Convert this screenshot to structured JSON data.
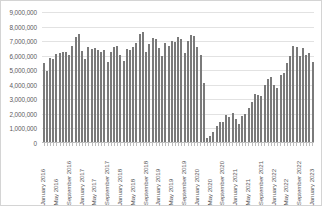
{
  "chart_data": {
    "type": "bar",
    "title": "",
    "subtitle": "",
    "xlabel": "",
    "ylabel": "",
    "ylim": [
      0,
      9000000
    ],
    "ytick_step": 1000000,
    "yticks": [
      "0",
      "1,000,000",
      "2,000,000",
      "3,000,000",
      "4,000,000",
      "5,000,000",
      "6,000,000",
      "7,000,000",
      "8,000,000",
      "9,000,000"
    ],
    "grid": true,
    "legend": "none",
    "bar_color": "#7a7a7a",
    "gridline_color": "#e2e2e2",
    "axis_color": "#bdbdbd",
    "border_color": "#d4d4d4",
    "text_color": "#59595b",
    "xtick_interval_months": 4,
    "xtick_labels": [
      "January 2016",
      "May 2016",
      "September 2016",
      "January 2017",
      "May 2017",
      "September 2017",
      "January 2018",
      "May 2018",
      "September 2018",
      "January 2019",
      "May 2019",
      "September 2019",
      "January 2020",
      "May 2020",
      "September 2020",
      "January 2021",
      "May 2021",
      "September 2021",
      "January 2022",
      "May 2022",
      "September 2022",
      "January 2023"
    ],
    "categories": [
      "January 2016",
      "February 2016",
      "March 2016",
      "April 2016",
      "May 2016",
      "June 2016",
      "July 2016",
      "August 2016",
      "September 2016",
      "October 2016",
      "November 2016",
      "December 2016",
      "January 2017",
      "February 2017",
      "March 2017",
      "April 2017",
      "May 2017",
      "June 2017",
      "July 2017",
      "August 2017",
      "September 2017",
      "October 2017",
      "November 2017",
      "December 2017",
      "January 2018",
      "February 2018",
      "March 2018",
      "April 2018",
      "May 2018",
      "June 2018",
      "July 2018",
      "August 2018",
      "September 2018",
      "October 2018",
      "November 2018",
      "December 2018",
      "January 2019",
      "February 2019",
      "March 2019",
      "April 2019",
      "May 2019",
      "June 2019",
      "July 2019",
      "August 2019",
      "September 2019",
      "October 2019",
      "November 2019",
      "December 2019",
      "January 2020",
      "February 2020",
      "March 2020",
      "April 2020",
      "May 2020",
      "June 2020",
      "July 2020",
      "August 2020",
      "September 2020",
      "October 2020",
      "November 2020",
      "December 2020",
      "January 2021",
      "February 2021",
      "March 2021",
      "April 2021",
      "May 2021",
      "June 2021",
      "July 2021",
      "August 2021",
      "September 2021",
      "October 2021",
      "November 2021",
      "December 2021",
      "January 2022",
      "February 2022",
      "March 2022",
      "April 2022",
      "May 2022",
      "June 2022",
      "July 2022",
      "August 2022",
      "September 2022",
      "October 2022",
      "November 2022",
      "December 2022",
      "January 2023"
    ],
    "values": [
      5400000,
      4850000,
      5750000,
      5700000,
      6050000,
      6100000,
      6200000,
      6150000,
      6000000,
      6600000,
      7200000,
      7400000,
      6250000,
      5700000,
      6500000,
      6400000,
      6450000,
      6300000,
      6200000,
      6350000,
      5500000,
      6150000,
      6500000,
      6600000,
      6000000,
      5600000,
      6400000,
      6300000,
      6550000,
      6800000,
      7400000,
      7550000,
      6150000,
      6750000,
      7150000,
      7050000,
      6450000,
      5900000,
      6800000,
      6600000,
      6950000,
      6900000,
      7200000,
      7050000,
      6100000,
      6950000,
      7350000,
      7250000,
      6550000,
      5950000,
      4050000,
      250000,
      400000,
      700000,
      1100000,
      1350000,
      1400000,
      1850000,
      1700000,
      2000000,
      1550000,
      1250000,
      1800000,
      1950000,
      2350000,
      2750000,
      3300000,
      3250000,
      3150000,
      3900000,
      4350000,
      4500000,
      3950000,
      3700000,
      4600000,
      4750000,
      5400000,
      5900000,
      6600000,
      6500000,
      5900000,
      6450000,
      6000000,
      6100000,
      5500000
    ]
  }
}
